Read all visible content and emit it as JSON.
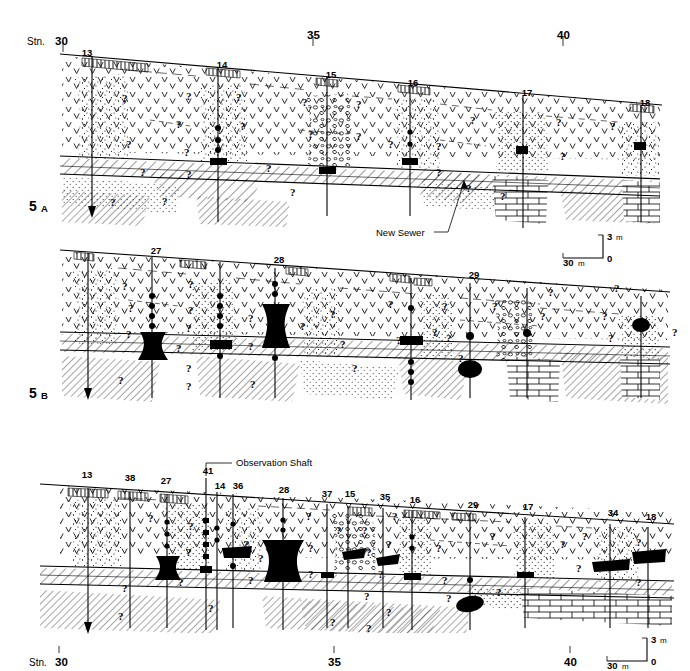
{
  "figure": {
    "type": "geological-cross-section",
    "panels": [
      {
        "id": "5A",
        "label": "5",
        "sublabel": "A",
        "station_axis": {
          "ticks": [
            {
              "label_prefix": "Stn.",
              "value": "30"
            },
            {
              "label_prefix": "",
              "value": "35"
            },
            {
              "label_prefix": "",
              "value": "40"
            }
          ]
        },
        "boreholes": [
          "13",
          "14",
          "15",
          "16",
          "17",
          "18"
        ],
        "annotations": [
          {
            "name": "new-sewer",
            "text": "New Sewer"
          }
        ],
        "scale_bar": {
          "vertical": "3",
          "vertical_unit": "m",
          "horizontal": "30",
          "horizontal_unit": "m",
          "origin": "0"
        }
      },
      {
        "id": "5B",
        "label": "5",
        "sublabel": "B",
        "boreholes": [
          "27",
          "28",
          "29"
        ],
        "annotations": [],
        "scale_bar": null
      },
      {
        "id": "5C",
        "label": "",
        "sublabel": "",
        "station_axis": {
          "ticks": [
            {
              "label_prefix": "Stn.",
              "value": "30"
            },
            {
              "label_prefix": "",
              "value": "35"
            },
            {
              "label_prefix": "",
              "value": "40"
            }
          ]
        },
        "boreholes": [
          "13",
          "38",
          "27",
          "41",
          "14",
          "36",
          "28",
          "37",
          "15",
          "35",
          "16",
          "29",
          "17",
          "34",
          "18"
        ],
        "annotations": [
          {
            "name": "observation-shaft",
            "text": "Observation Shaft"
          }
        ],
        "scale_bar": {
          "vertical": "3",
          "vertical_unit": "m",
          "horizontal": "30",
          "horizontal_unit": "m",
          "origin": "0"
        }
      }
    ],
    "query_marker": "?",
    "colors": {
      "ink": "#000000",
      "paper": "#ffffff"
    },
    "legend_patterns": [
      {
        "name": "made-ground-vees",
        "glyph": "v"
      },
      {
        "name": "sand-stipple",
        "glyph": "."
      },
      {
        "name": "gravel-ovals",
        "glyph": "o"
      },
      {
        "name": "clay-till-hatch",
        "glyph": "/"
      },
      {
        "name": "bedrock-brick",
        "glyph": "brick"
      },
      {
        "name": "peat-solid-black",
        "glyph": "solid"
      }
    ]
  },
  "labels": {
    "stn_prefix": "Stn.",
    "stn_30": "30",
    "stn_35": "35",
    "stn_40": "40",
    "bh13": "13",
    "bh14": "14",
    "bh15": "15",
    "bh16": "16",
    "bh17": "17",
    "bh18": "18",
    "bh27": "27",
    "bh28": "28",
    "bh29": "29",
    "bh34": "34",
    "bh35": "35",
    "bh36": "36",
    "bh37": "37",
    "bh38": "38",
    "bh41": "41",
    "sec5": "5",
    "secA": "A",
    "secB": "B",
    "new_sewer": "New Sewer",
    "observation_shaft": "Observation Shaft",
    "scale_v": "3",
    "scale_v_u": "m",
    "scale_h": "30",
    "scale_h_u": "m",
    "scale_zero": "0",
    "q": "?"
  }
}
